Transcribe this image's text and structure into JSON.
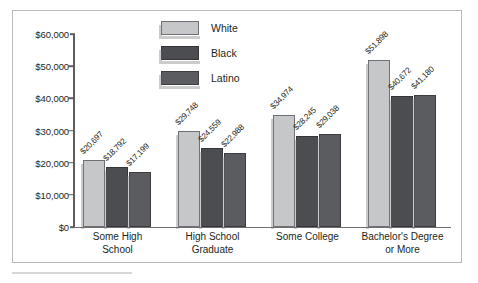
{
  "chart_data": {
    "type": "bar",
    "title": "",
    "xlabel": "",
    "ylabel": "",
    "ylim": [
      0,
      60000
    ],
    "grid": false,
    "legend_position": "top-center",
    "orientation": "vertical",
    "grouping": "grouped",
    "categories": [
      "Some High School",
      "High School Graduate",
      "Some College",
      "Bachelor's Degree or More"
    ],
    "category_lines": [
      [
        "Some High",
        "School"
      ],
      [
        "High School",
        "Graduate"
      ],
      [
        "Some College",
        ""
      ],
      [
        "Bachelor's Degree",
        "or More"
      ]
    ],
    "series": [
      {
        "name": "White",
        "color": "#c6c7c9",
        "values": [
          20697,
          29748,
          34974,
          51898
        ],
        "labels": [
          "$20,697",
          "$29,748",
          "$34,974",
          "$51,898"
        ]
      },
      {
        "name": "Black",
        "color": "#4c4d50",
        "values": [
          18792,
          24559,
          28245,
          40672
        ],
        "labels": [
          "$18,792",
          "$24,559",
          "$28,245",
          "$40,672"
        ]
      },
      {
        "name": "Latino",
        "color": "#5a5c5f",
        "values": [
          17199,
          22988,
          29038,
          41180
        ],
        "labels": [
          "$17,199",
          "$22,988",
          "$29,038",
          "$41,180"
        ]
      }
    ],
    "y_ticks": [
      0,
      10000,
      20000,
      30000,
      40000,
      50000,
      60000
    ],
    "y_tick_labels": [
      "$0",
      "$10,000",
      "$20,000",
      "$30,000",
      "$40,000",
      "$50,000",
      "$60,000"
    ]
  },
  "legend": {
    "items": [
      {
        "label": "White",
        "swatch": "white-swatch"
      },
      {
        "label": "Black",
        "swatch": "black-swatch"
      },
      {
        "label": "Latino",
        "swatch": "latino-swatch"
      }
    ]
  },
  "colors": {
    "white_series": "#c6c7c9",
    "black_series": "#4c4d50",
    "latino_series": "#5a5c5f",
    "axis": "#5d5d5d",
    "frame": "#b9b9b9",
    "text": "#231f20"
  }
}
